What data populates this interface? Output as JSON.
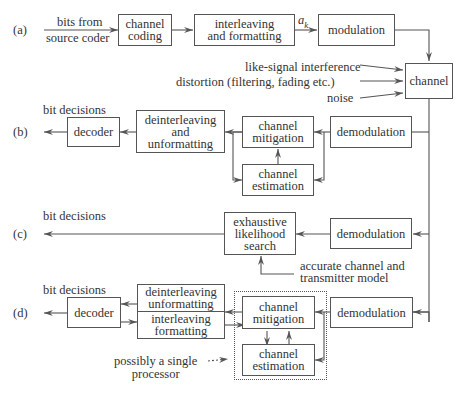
{
  "rows": {
    "a": {
      "label": "(a)",
      "input_top": "bits from",
      "input_bottom": "source coder",
      "channel_coding": [
        "channel",
        "coding"
      ],
      "interleaving": [
        "interleaving",
        "and formatting"
      ],
      "symbol": "a",
      "symbol_sub": "k",
      "modulation": "modulation"
    },
    "channel": {
      "label": "channel",
      "inputs": [
        "like-signal interference",
        "distortion (filtering, fading etc.)",
        "noise"
      ]
    },
    "b": {
      "label": "(b)",
      "output": "bit decisions",
      "decoder": "decoder",
      "deinterleaving": [
        "deinterleaving",
        "and",
        "unformatting"
      ],
      "mitigation": [
        "channel",
        "mitigation"
      ],
      "estimation": [
        "channel",
        "estimation"
      ],
      "demodulation": "demodulation"
    },
    "c": {
      "label": "(c)",
      "output": "bit decisions",
      "search": [
        "exhaustive",
        "likelihood",
        "search"
      ],
      "demodulation": "demodulation",
      "model": [
        "accurate channel and",
        "transmitter model"
      ]
    },
    "d": {
      "label": "(d)",
      "output": "bit decisions",
      "decoder": "decoder",
      "deinterleaving": [
        "deinterleaving",
        "unformatting"
      ],
      "interleaving": [
        "interleaving",
        "formatting"
      ],
      "mitigation": [
        "channel",
        "mitigation"
      ],
      "estimation": [
        "channel",
        "estimation"
      ],
      "demodulation": "demodulation",
      "processor_note": [
        "possibly a single",
        "processor"
      ]
    }
  }
}
